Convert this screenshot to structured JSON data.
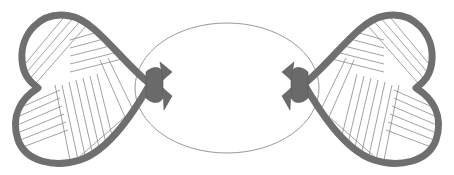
{
  "figure": {
    "colors": {
      "background": "#ffffff",
      "heart_outline": "#6f6f6f",
      "stripe_lines": "#8a8a8a",
      "oval_outline": "#9a9a9a",
      "bow": "#6a6a6a"
    },
    "elements": [
      "left-heart",
      "right-heart",
      "center-oval",
      "left-bow",
      "right-bow"
    ]
  }
}
